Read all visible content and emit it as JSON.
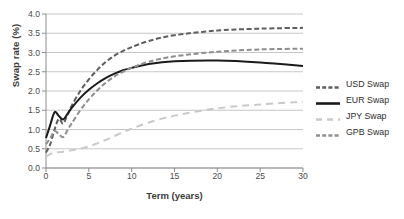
{
  "chart_data": {
    "type": "line",
    "title": "",
    "xlabel": "Term (years)",
    "ylabel": "Swap rate (%)",
    "xlim": [
      0,
      30
    ],
    "ylim": [
      0,
      4.0
    ],
    "xticks": [
      0,
      5,
      10,
      15,
      20,
      25,
      30
    ],
    "yticks": [
      "0.0",
      "0.5",
      "1.0",
      "1.5",
      "2.0",
      "2.5",
      "3.0",
      "3.5",
      "4.0"
    ],
    "grid": "horizontal",
    "legend_position": "right",
    "x": [
      0,
      0.5,
      1,
      1.5,
      2,
      2.5,
      3,
      4,
      5,
      6,
      7,
      8,
      9,
      10,
      12,
      15,
      20,
      25,
      30
    ],
    "series": [
      {
        "name": "USD Swap",
        "color": "#5e5e5e",
        "style": "dashed",
        "values": [
          0.4,
          0.62,
          1.0,
          1.28,
          1.15,
          1.38,
          1.62,
          2.0,
          2.3,
          2.55,
          2.76,
          2.92,
          3.04,
          3.14,
          3.3,
          3.45,
          3.57,
          3.62,
          3.64
        ]
      },
      {
        "name": "EUR Swap",
        "color": "#1a1a1a",
        "style": "solid",
        "values": [
          0.78,
          1.12,
          1.45,
          1.35,
          1.26,
          1.4,
          1.56,
          1.82,
          2.03,
          2.2,
          2.34,
          2.45,
          2.54,
          2.6,
          2.7,
          2.77,
          2.79,
          2.74,
          2.65
        ]
      },
      {
        "name": "JPY Swap",
        "color": "#c9c9c9",
        "style": "dashed-long",
        "values": [
          0.3,
          0.36,
          0.4,
          0.41,
          0.42,
          0.44,
          0.46,
          0.5,
          0.56,
          0.64,
          0.73,
          0.83,
          0.93,
          1.02,
          1.18,
          1.36,
          1.55,
          1.65,
          1.72
        ]
      },
      {
        "name": "GPB Swap",
        "color": "#8e8e8e",
        "style": "dashed",
        "values": [
          0.62,
          0.78,
          0.96,
          0.88,
          0.8,
          0.98,
          1.16,
          1.5,
          1.78,
          2.02,
          2.22,
          2.38,
          2.5,
          2.6,
          2.76,
          2.9,
          3.02,
          3.08,
          3.1
        ]
      }
    ]
  },
  "legend": {
    "items": [
      {
        "label": "USD Swap"
      },
      {
        "label": "EUR Swap"
      },
      {
        "label": "JPY Swap"
      },
      {
        "label": "GPB Swap"
      }
    ]
  }
}
